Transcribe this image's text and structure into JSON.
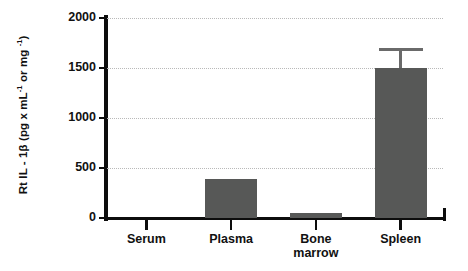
{
  "chart_data": {
    "type": "bar",
    "title": "",
    "subtitle": "",
    "xlabel": "",
    "ylabel": "Rt IL - 1β  (pg x mL⁻¹ or mg ⁻¹)",
    "ylabel_parts": {
      "prefix": "Rt IL - 1β  (pg x mL",
      "sup1": "-1",
      "middle": " or mg ",
      "sup2": "-1",
      "suffix": ")"
    },
    "categories": [
      "Serum",
      "Plasma",
      "Bone marrow",
      "Spleen"
    ],
    "category_lines": [
      [
        "Serum"
      ],
      [
        "Plasma"
      ],
      [
        "Bone",
        "marrow"
      ],
      [
        "Spleen"
      ]
    ],
    "values": [
      0,
      390,
      50,
      1500
    ],
    "errors": [
      0,
      0,
      0,
      200
    ],
    "ylim": [
      0,
      2000
    ],
    "yticks": [
      0,
      500,
      1000,
      1500,
      2000
    ],
    "ytick_labels": [
      "0",
      "500",
      "1000",
      "1500",
      "2000"
    ],
    "grid": "horizontal-dotted",
    "legend": "none",
    "bar_color": "#575857",
    "error_color": "#6a6a6a",
    "axis_color": "#0d0d0d",
    "grid_color": "#b9b9b9",
    "background": "#ffffff"
  }
}
